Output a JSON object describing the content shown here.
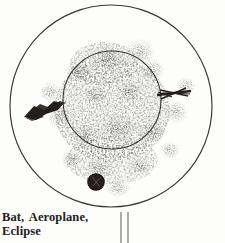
{
  "page": {
    "width": 225,
    "height": 243,
    "background_color": "#fdfdfb",
    "ink_color": "#2b2724"
  },
  "plate": {
    "kind": "inkblot-plate",
    "outer_circle": {
      "cx": 111,
      "cy": 106,
      "r": 101,
      "stroke": "#3a3532"
    },
    "inner_circle": {
      "cx": 112,
      "cy": 100,
      "r": 49,
      "stroke": "#3a3532"
    },
    "stem": {
      "label": "stem",
      "left_x": 121,
      "right_x": 128,
      "top_y": 212,
      "bottom_y": 243,
      "stroke": "#6d6660"
    },
    "figures": [
      {
        "name": "bat",
        "cx": 44,
        "cy": 108,
        "note": "dark angular winged mark at left"
      },
      {
        "name": "aeroplane",
        "cx": 174,
        "cy": 94,
        "note": "dark swept streak at right"
      },
      {
        "name": "eclipse",
        "cx": 96,
        "cy": 182,
        "note": "dark round disc at lower centre"
      }
    ]
  },
  "caption": {
    "line_1": "Bat,  Aeroplane,",
    "line_2": "Eclipse"
  }
}
